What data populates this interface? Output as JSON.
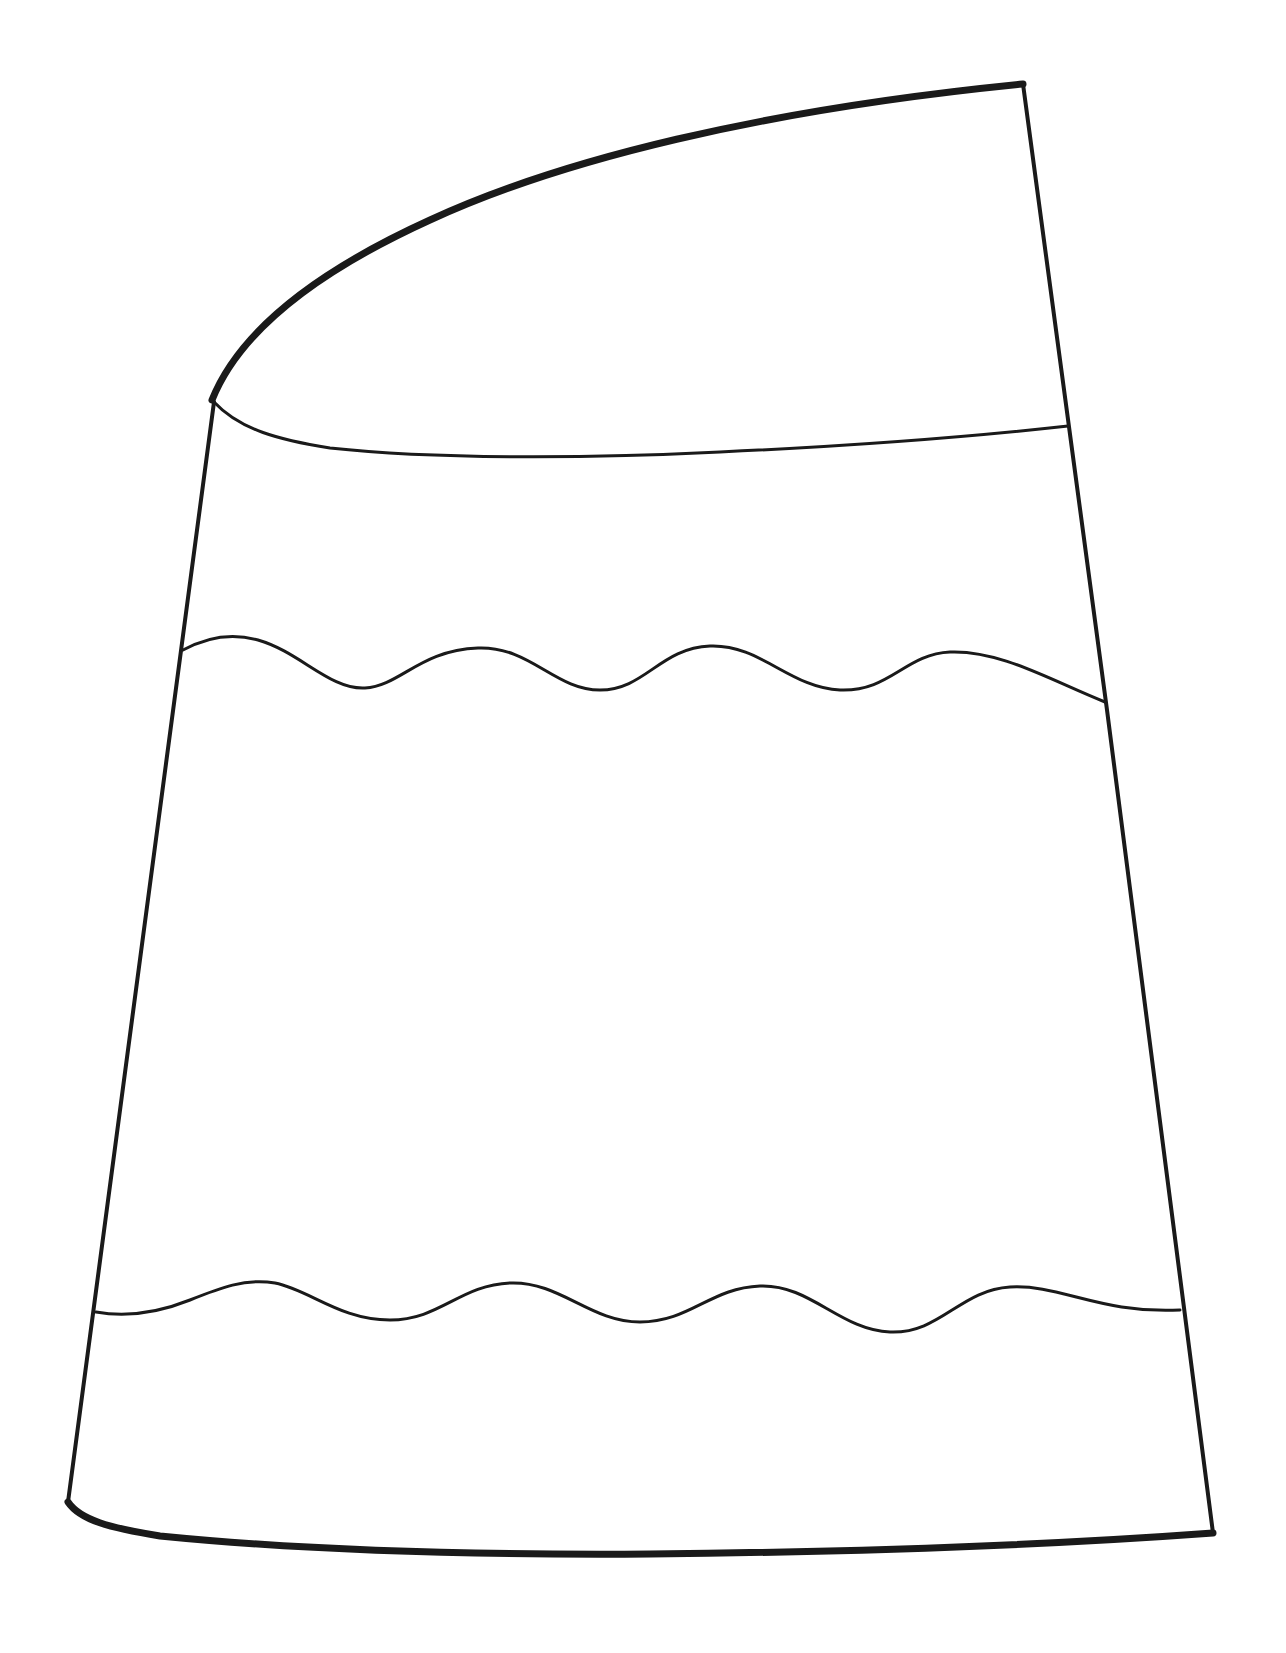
{
  "drawing": {
    "subject": "crayon tip outline",
    "background": "#ffffff",
    "stroke_color": "#1a1a1a",
    "elements": [
      "tip-top-curve",
      "tip-right-edge",
      "label-top-band-line",
      "left-body-edge",
      "right-body-edge",
      "upper-wavy-band",
      "lower-wavy-band",
      "bottom-curve"
    ]
  }
}
